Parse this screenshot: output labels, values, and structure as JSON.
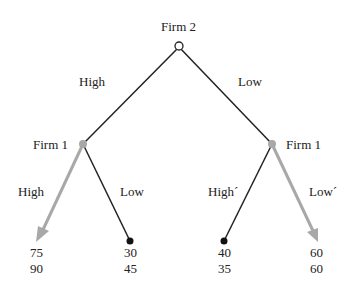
{
  "root": {
    "player": "Firm 2"
  },
  "branches_root": [
    {
      "label": "High"
    },
    {
      "label": "Low"
    }
  ],
  "subgames": [
    {
      "player": "Firm 1",
      "actions": [
        {
          "label": "High",
          "payoff_top": "75",
          "payoff_bottom": "90",
          "highlighted": true
        },
        {
          "label": "Low",
          "payoff_top": "30",
          "payoff_bottom": "45",
          "highlighted": false
        }
      ]
    },
    {
      "player": "Firm 1",
      "actions": [
        {
          "label": "High´",
          "payoff_top": "40",
          "payoff_bottom": "35",
          "highlighted": false
        },
        {
          "label": "Low´",
          "payoff_top": "60",
          "payoff_bottom": "60",
          "highlighted": true
        }
      ]
    }
  ],
  "colors": {
    "line": "#222222",
    "highlight": "#a8a8a8"
  }
}
